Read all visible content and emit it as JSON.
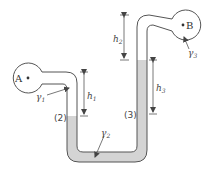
{
  "diagram": {
    "type": "manometer",
    "colors": {
      "stroke": "#555555",
      "liquid_fill": "#d4d4d4",
      "background": "#ffffff",
      "text": "#444444"
    },
    "vessels": [
      {
        "id": "A",
        "label": "A"
      },
      {
        "id": "B",
        "label": "B"
      }
    ],
    "fluids": [
      {
        "label": "γ",
        "sub": "1"
      },
      {
        "label": "γ",
        "sub": "2"
      },
      {
        "label": "γ",
        "sub": "3"
      }
    ],
    "heights": [
      {
        "label": "h",
        "sub": "1"
      },
      {
        "label": "h",
        "sub": "2"
      },
      {
        "label": "h",
        "sub": "3"
      }
    ],
    "points": [
      {
        "label": "(2)"
      },
      {
        "label": "(3)"
      }
    ]
  }
}
